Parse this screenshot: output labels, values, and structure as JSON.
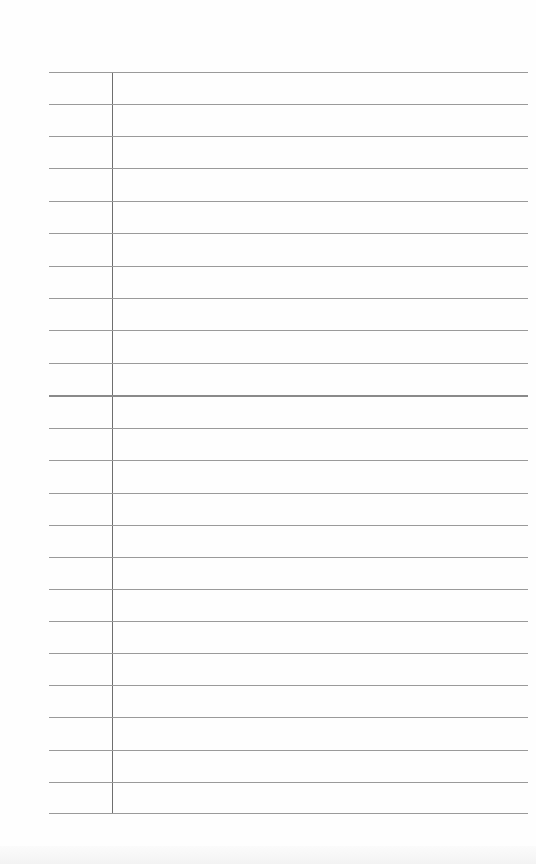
{
  "page": {
    "type": "lined-paper",
    "background_color": "#fefefe",
    "rule_color": "#9a9a9a",
    "margin_line_color": "#6e6e6e",
    "rules_y": [
      72,
      104,
      136,
      168,
      201,
      233,
      266,
      298,
      330,
      363,
      395,
      428,
      460,
      493,
      525,
      557,
      589,
      621,
      653,
      685,
      717,
      750,
      782,
      813
    ],
    "thick_rule_index": 10,
    "rule_x_start": 49,
    "rule_x_end": 528,
    "margin_line": {
      "x": 112,
      "y_start": 72,
      "y_end": 814
    }
  }
}
